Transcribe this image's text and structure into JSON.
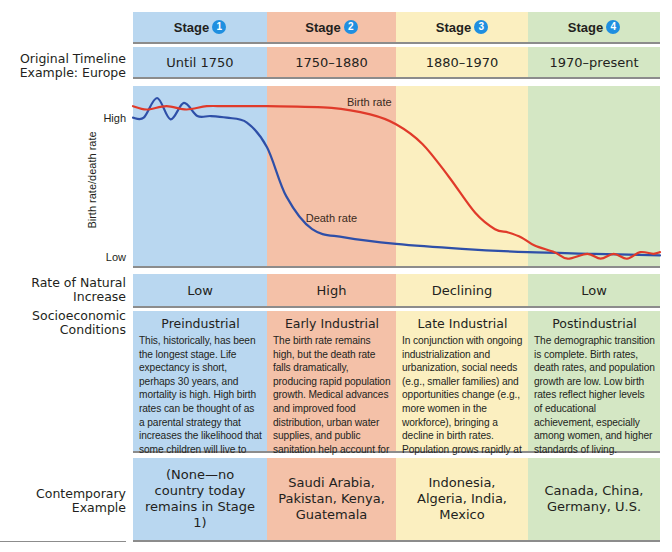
{
  "stages": [
    {
      "label": "Stage",
      "number": "1",
      "color": "#b9d7f0"
    },
    {
      "label": "Stage",
      "number": "2",
      "color": "#f4c1a8"
    },
    {
      "label": "Stage",
      "number": "3",
      "color": "#fbefc0"
    },
    {
      "label": "Stage",
      "number": "4",
      "color": "#d4e7c4"
    }
  ],
  "timeline": {
    "label_line1": "Original Timeline",
    "label_line2": "Example: Europe",
    "values": [
      "Until 1750",
      "1750–1880",
      "1880–1970",
      "1970–present"
    ]
  },
  "natural_increase": {
    "label_line1": "Rate of Natural",
    "label_line2": "Increase",
    "values": [
      "Low",
      "High",
      "Declining",
      "Low"
    ]
  },
  "socioeconomic": {
    "label_line1": "Socioeconomic",
    "label_line2": "Conditions",
    "cells": [
      {
        "title": "Preindustrial",
        "text": "This, historically, has been the longest stage. Life expectancy is short, perhaps 30 years, and mortality is high. High birth rates can be thought of as a parental strategy that increases the likelihood that some children will live to adulthood. Overall, there is little increase in population."
      },
      {
        "title": "Early Industrial",
        "text": "The birth rate remains high, but the death rate falls dramatically, producing rapid population growth. Medical advances and improved food distribution, urban water supplies, and public sanitation help account for declining death rates in this stage."
      },
      {
        "title": "Late Industrial",
        "text": "In conjunction with ongoing industrialization and urbanization, social needs (e.g., smaller families) and opportunities change (e.g., more women in the workforce), bringing a decline in birth rates. Population grows rapidly at first but slows over time."
      },
      {
        "title": "Postindustrial",
        "text": "The demographic transition is complete. Birth rates, death rates, and population growth are low. Low birth rates reflect higher levels of educational achievement, especially among women, and higher standards of living."
      }
    ]
  },
  "contemporary": {
    "label_line1": "Contemporary",
    "label_line2": "Example",
    "values": [
      "(None—no country today remains in Stage 1)",
      "Saudi Arabia, Pakistan, Kenya, Guatemala",
      "Indonesia, Algeria, India, Mexico",
      "Canada, China, Germany, U.S."
    ]
  },
  "chart_data": {
    "type": "line",
    "title": "",
    "xlabel": "",
    "ylabel": "Birth rate/death rate",
    "yticks": [
      "High",
      "Low"
    ],
    "ylim": [
      0,
      1
    ],
    "xlim": [
      0,
      4
    ],
    "x_regions": [
      "Stage 1",
      "Stage 2",
      "Stage 3",
      "Stage 4"
    ],
    "legend": "inline labels",
    "series": [
      {
        "name": "Birth rate",
        "color": "#e03a2a",
        "label_at": 1.75,
        "x": [
          0,
          0.1,
          0.25,
          0.4,
          0.55,
          0.7,
          1.0,
          1.5,
          1.8,
          2.0,
          2.2,
          2.4,
          2.6,
          2.75,
          2.85,
          2.95,
          3.05,
          3.2,
          3.3,
          3.45,
          3.55,
          3.65,
          3.75,
          3.85,
          3.95,
          4.0
        ],
        "y": [
          0.95,
          0.93,
          0.95,
          0.93,
          0.95,
          0.95,
          0.95,
          0.94,
          0.9,
          0.84,
          0.72,
          0.52,
          0.3,
          0.2,
          0.18,
          0.15,
          0.1,
          0.06,
          0.02,
          0.05,
          0.02,
          0.05,
          0.02,
          0.06,
          0.05,
          0.06
        ]
      },
      {
        "name": "Death rate",
        "color": "#2e4fa8",
        "label_at": 1.3,
        "x": [
          0,
          0.08,
          0.18,
          0.28,
          0.38,
          0.48,
          0.58,
          0.7,
          0.85,
          1.0,
          1.15,
          1.35,
          1.6,
          2.0,
          2.5,
          3.0,
          3.5,
          4.0
        ],
        "y": [
          0.88,
          0.88,
          1.0,
          0.87,
          0.97,
          0.89,
          0.89,
          0.88,
          0.85,
          0.7,
          0.4,
          0.2,
          0.15,
          0.11,
          0.08,
          0.06,
          0.05,
          0.04
        ]
      }
    ]
  }
}
